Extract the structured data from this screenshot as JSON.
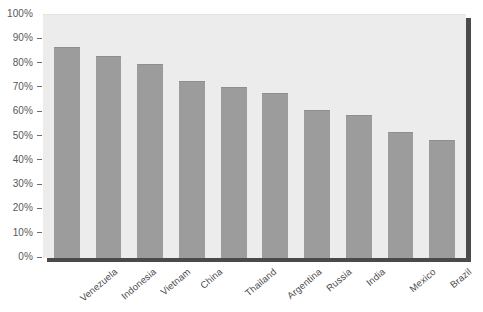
{
  "chart_data": {
    "type": "bar",
    "title": "",
    "subtitle": "",
    "xlabel": "",
    "ylabel": "",
    "categories": [
      "Venezuela",
      "Indonesia",
      "Vietnam",
      "China",
      "Thailand",
      "Argentina",
      "Russia",
      "India",
      "Mexico",
      "Brazil"
    ],
    "values": [
      87,
      83,
      80,
      73,
      70.5,
      68,
      61,
      59,
      52,
      48.5
    ],
    "value_suffix": "%",
    "ylim": [
      0,
      100
    ],
    "ytick_labels": [
      "100%",
      "90%",
      "80%",
      "70%",
      "60%",
      "50%",
      "40%",
      "30%",
      "20%",
      "10%",
      "0%"
    ],
    "ytick_values": [
      100,
      90,
      80,
      70,
      60,
      50,
      40,
      30,
      20,
      10,
      0
    ],
    "grid": false,
    "legend": "none",
    "series": [
      {
        "name": "",
        "values": [
          87,
          83,
          80,
          73,
          70.5,
          68,
          61,
          59,
          52,
          48.5
        ]
      }
    ],
    "colors": {
      "bar": "#9c9c9c",
      "plot_background": "#ececec",
      "frame_shadow": "#4a4a4a",
      "tick_label": "#58585a",
      "category_label": "#4a4a4c",
      "page_background": "#ffffff"
    }
  }
}
